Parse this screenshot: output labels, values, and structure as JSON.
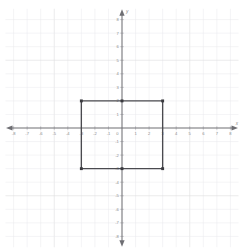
{
  "chart_data": {
    "type": "scatter",
    "title": "",
    "subtitle": "",
    "xlabel": "x",
    "ylabel": "y",
    "xlim": [
      -8.6,
      8.6
    ],
    "ylim": [
      -8.8,
      8.8
    ],
    "grid": true,
    "grid_step": 1,
    "legend": "none",
    "x_ticks": [
      -8,
      -7,
      -6,
      -5,
      -4,
      -3,
      -2,
      -1,
      0,
      1,
      2,
      3,
      4,
      5,
      6,
      7,
      8
    ],
    "y_ticks": [
      -8,
      -7,
      -6,
      -5,
      -4,
      -3,
      -2,
      -1,
      0,
      1,
      2,
      3,
      4,
      5,
      6,
      7,
      8
    ],
    "x_tick_labels": [
      "-8",
      "-7",
      "-6",
      "-5",
      "-4",
      "-3",
      "-2",
      "-1",
      "0",
      "1",
      "2",
      "3",
      "4",
      "5",
      "6",
      "7",
      "8"
    ],
    "y_tick_labels": [
      "-8",
      "-7",
      "-6",
      "-5",
      "-4",
      "-3",
      "-2",
      "-1",
      "0",
      "1",
      "2",
      "3",
      "4",
      "5",
      "6",
      "7",
      "8"
    ],
    "origin_label": "0",
    "series": [
      {
        "name": "rectangle",
        "type": "polygon",
        "closed": true,
        "vertices": [
          {
            "x": -3,
            "y": 2
          },
          {
            "x": 3,
            "y": 2
          },
          {
            "x": 3,
            "y": -3
          },
          {
            "x": -3,
            "y": -3
          }
        ],
        "marked_points": [
          {
            "x": -3,
            "y": 2
          },
          {
            "x": 0,
            "y": 2
          },
          {
            "x": 3,
            "y": 2
          },
          {
            "x": -3,
            "y": -3
          },
          {
            "x": 0,
            "y": -3
          },
          {
            "x": 3,
            "y": -3
          }
        ],
        "width_units": 6,
        "height_units": 5,
        "edge_color": "#4a4a4f",
        "vertex_color": "#3a3a3f"
      }
    ],
    "colors": {
      "background": "#ffffff",
      "grid_minor": "#e9e9ec",
      "grid_major": "#dededf",
      "axis": "#6e6e73",
      "tick_text": "#8a8a8a",
      "shape_stroke": "#4a4a4f",
      "vertex": "#3a3a3f"
    }
  },
  "axes": {
    "x_axis_name": "x",
    "y_axis_name": "y"
  }
}
